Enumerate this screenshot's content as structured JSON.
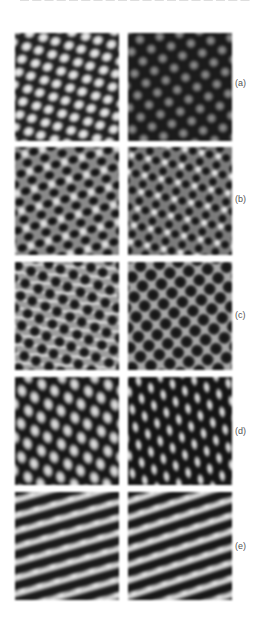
{
  "page": {
    "header_text_cut": "— — — — — — — — — — — — — — — — — — — — — — — — —"
  },
  "figure": {
    "rows": [
      {
        "label": "(a)",
        "panels": [
          {
            "position": "left",
            "pattern": "bright blobs on dark background, tilted lattice"
          },
          {
            "position": "right",
            "pattern": "dim grey dots on very dark background, hexagonal lattice"
          }
        ]
      },
      {
        "label": "(b)",
        "panels": [
          {
            "position": "left",
            "pattern": "dark blobs with bright triangular spots, honeycomb"
          },
          {
            "position": "right",
            "pattern": "dark blobs with bright triangular spots, finer honeycomb"
          }
        ]
      },
      {
        "label": "(c)",
        "panels": [
          {
            "position": "left",
            "pattern": "dark holes on light wavy background"
          },
          {
            "position": "right",
            "pattern": "dark circular holes on grey, hexagonal lattice"
          }
        ]
      },
      {
        "label": "(d)",
        "panels": [
          {
            "position": "left",
            "pattern": "bright elongated blobs on dark background"
          },
          {
            "position": "right",
            "pattern": "vertical bright blobs in checkerboard arrangement"
          }
        ]
      },
      {
        "label": "(e)",
        "panels": [
          {
            "position": "left",
            "pattern": "tilted bright modulated stripes"
          },
          {
            "position": "right",
            "pattern": "tilted bright stripes"
          }
        ]
      }
    ]
  },
  "colors": {
    "background": "#ffffff",
    "label": "#555555",
    "dark": "#1b1b1b",
    "bright": "#eeeeee",
    "mid_grey": "#a8a8a8"
  }
}
